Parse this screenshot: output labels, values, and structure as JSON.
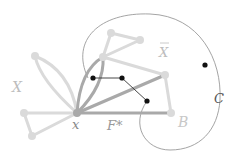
{
  "labels": {
    "X": "X",
    "Xbar": "X",
    "x": "x",
    "F": "F*",
    "B": "B",
    "C": "C"
  },
  "colors": {
    "light_gray": "#d6d6d6",
    "mid_gray": "#a8a8a8",
    "dark_node": "#111111",
    "curve": "#888888",
    "label_gray": "#bdbdbd",
    "label_dark": "#555555"
  }
}
